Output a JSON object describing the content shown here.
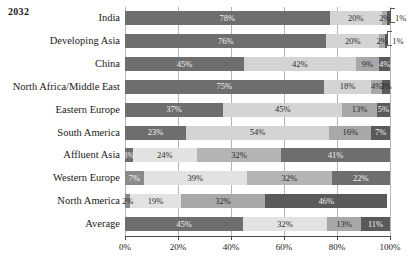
{
  "title": "2032",
  "chart_data": {
    "type": "bar",
    "title": "2032",
    "subtype": "horizontal-stacked-100",
    "xlabel": "",
    "ylabel": "",
    "xlim": [
      0,
      100
    ],
    "xticks": [
      "0%",
      "20%",
      "40%",
      "60%",
      "80%",
      "100%"
    ],
    "xtick_values": [
      0,
      20,
      40,
      60,
      80,
      100
    ],
    "grid": true,
    "legend": "none",
    "orientation": "horizontal",
    "series": [
      {
        "name": "segment-1",
        "color": "#6e6e6e"
      },
      {
        "name": "segment-2",
        "color": "#d4d4d4"
      },
      {
        "name": "segment-3",
        "color": "#a8a8a8"
      },
      {
        "name": "segment-4",
        "color": "#5a5a5a"
      }
    ],
    "categories": [
      "India",
      "Developing Asia",
      "China",
      "North Africa/Middle East",
      "Eastern Europe",
      "South America",
      "Affluent Asia",
      "Western Europe",
      "North America",
      "Average"
    ],
    "rows": [
      {
        "category": "India",
        "segments": [
          {
            "value": 78,
            "label": "78%",
            "color": "#6e6e6e",
            "label_color": "light",
            "label_placement": "inside"
          },
          {
            "value": 20,
            "label": "20%",
            "color": "#d4d4d4",
            "label_color": "dark",
            "label_placement": "inside"
          },
          {
            "value": 2,
            "label": "2%",
            "color": "#a8a8a8",
            "label_color": "dark",
            "label_placement": "inside"
          },
          {
            "value": 1,
            "label": "1%",
            "color": "#5a5a5a",
            "label_color": "dark",
            "label_placement": "outside-leader"
          }
        ]
      },
      {
        "category": "Developing Asia",
        "segments": [
          {
            "value": 76,
            "label": "76%",
            "color": "#6e6e6e",
            "label_color": "light",
            "label_placement": "inside"
          },
          {
            "value": 20,
            "label": "20%",
            "color": "#d4d4d4",
            "label_color": "dark",
            "label_placement": "inside"
          },
          {
            "value": 2,
            "label": "2%",
            "color": "#a8a8a8",
            "label_color": "dark",
            "label_placement": "inside"
          },
          {
            "value": 1,
            "label": "1%",
            "color": "#5a5a5a",
            "label_color": "dark",
            "label_placement": "outside-leader"
          }
        ]
      },
      {
        "category": "China",
        "segments": [
          {
            "value": 45,
            "label": "45%",
            "color": "#6e6e6e",
            "label_color": "light",
            "label_placement": "inside"
          },
          {
            "value": 42,
            "label": "42%",
            "color": "#d4d4d4",
            "label_color": "dark",
            "label_placement": "inside"
          },
          {
            "value": 9,
            "label": "9%",
            "color": "#a8a8a8",
            "label_color": "dark",
            "label_placement": "inside"
          },
          {
            "value": 4,
            "label": "4%",
            "color": "#5a5a5a",
            "label_color": "light",
            "label_placement": "inside"
          }
        ]
      },
      {
        "category": "North Africa/Middle East",
        "segments": [
          {
            "value": 75,
            "label": "75%",
            "color": "#6e6e6e",
            "label_color": "light",
            "label_placement": "inside"
          },
          {
            "value": 18,
            "label": "18%",
            "color": "#d4d4d4",
            "label_color": "dark",
            "label_placement": "inside"
          },
          {
            "value": 4,
            "label": "4%",
            "color": "#a8a8a8",
            "label_color": "dark",
            "label_placement": "inside"
          },
          {
            "value": 3,
            "label": "3%",
            "color": "#5a5a5a",
            "label_color": "dark",
            "label_placement": "inside"
          }
        ]
      },
      {
        "category": "Eastern Europe",
        "segments": [
          {
            "value": 37,
            "label": "37%",
            "color": "#6e6e6e",
            "label_color": "light",
            "label_placement": "inside"
          },
          {
            "value": 45,
            "label": "45%",
            "color": "#d4d4d4",
            "label_color": "dark",
            "label_placement": "inside"
          },
          {
            "value": 13,
            "label": "13%",
            "color": "#a8a8a8",
            "label_color": "dark",
            "label_placement": "inside"
          },
          {
            "value": 5,
            "label": "5%",
            "color": "#5a5a5a",
            "label_color": "light",
            "label_placement": "inside"
          }
        ]
      },
      {
        "category": "South America",
        "segments": [
          {
            "value": 23,
            "label": "23%",
            "color": "#6e6e6e",
            "label_color": "light",
            "label_placement": "inside"
          },
          {
            "value": 54,
            "label": "54%",
            "color": "#d4d4d4",
            "label_color": "dark",
            "label_placement": "inside"
          },
          {
            "value": 16,
            "label": "16%",
            "color": "#a8a8a8",
            "label_color": "dark",
            "label_placement": "inside"
          },
          {
            "value": 7,
            "label": "7%",
            "color": "#5a5a5a",
            "label_color": "light",
            "label_placement": "inside"
          }
        ]
      },
      {
        "category": "Affluent Asia",
        "segments": [
          {
            "value": 3,
            "label": "3%",
            "color": "#6e6e6e",
            "label_color": "light",
            "label_placement": "inside"
          },
          {
            "value": 24,
            "label": "24%",
            "color": "#e2e2e2",
            "label_color": "dark",
            "label_placement": "inside"
          },
          {
            "value": 32,
            "label": "32%",
            "color": "#b4b4b4",
            "label_color": "dark",
            "label_placement": "inside"
          },
          {
            "value": 41,
            "label": "41%",
            "color": "#6e6e6e",
            "label_color": "light",
            "label_placement": "inside"
          }
        ]
      },
      {
        "category": "Western Europe",
        "segments": [
          {
            "value": 7,
            "label": "7%",
            "color": "#8a8a8a",
            "label_color": "light",
            "label_placement": "inside"
          },
          {
            "value": 39,
            "label": "39%",
            "color": "#e2e2e2",
            "label_color": "dark",
            "label_placement": "inside"
          },
          {
            "value": 32,
            "label": "32%",
            "color": "#b4b4b4",
            "label_color": "dark",
            "label_placement": "inside"
          },
          {
            "value": 22,
            "label": "22%",
            "color": "#6e6e6e",
            "label_color": "light",
            "label_placement": "inside"
          }
        ]
      },
      {
        "category": "North America",
        "segments": [
          {
            "value": 2,
            "label": "2%",
            "color": "#8a8a8a",
            "label_color": "dark",
            "label_placement": "inside"
          },
          {
            "value": 19,
            "label": "19%",
            "color": "#e2e2e2",
            "label_color": "dark",
            "label_placement": "inside"
          },
          {
            "value": 32,
            "label": "32%",
            "color": "#a8a8a8",
            "label_color": "dark",
            "label_placement": "inside"
          },
          {
            "value": 46,
            "label": "46%",
            "color": "#5a5a5a",
            "label_color": "light",
            "label_placement": "inside"
          }
        ]
      },
      {
        "category": "Average",
        "segments": [
          {
            "value": 45,
            "label": "45%",
            "color": "#6e6e6e",
            "label_color": "light",
            "label_placement": "inside"
          },
          {
            "value": 32,
            "label": "32%",
            "color": "#e2e2e2",
            "label_color": "dark",
            "label_placement": "inside"
          },
          {
            "value": 13,
            "label": "13%",
            "color": "#a8a8a8",
            "label_color": "dark",
            "label_placement": "inside"
          },
          {
            "value": 11,
            "label": "11%",
            "color": "#5a5a5a",
            "label_color": "light",
            "label_placement": "inside"
          }
        ]
      }
    ]
  }
}
